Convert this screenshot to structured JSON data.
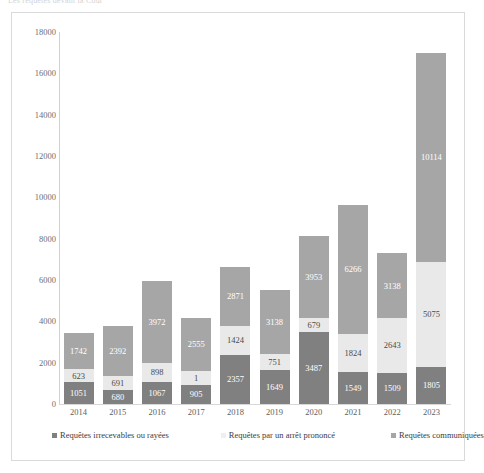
{
  "top_caption": "Les requêtes devant la Cour",
  "chart_data": {
    "type": "bar",
    "subtype": "stacked-vertical",
    "title": "",
    "xlabel": "",
    "ylabel": "",
    "ylim": [
      0,
      18000
    ],
    "ytick_step": 2000,
    "yticks": [
      "0",
      "2000",
      "4000",
      "6000",
      "8000",
      "10000",
      "12000",
      "14000",
      "16000",
      "18000"
    ],
    "grid": false,
    "legend_position": "bottom",
    "categories": [
      "2014",
      "2015",
      "2016",
      "2017",
      "2018",
      "2019",
      "2020",
      "2021",
      "2022",
      "2023"
    ],
    "series": [
      {
        "name": "Requêtes irrecevables ou rayées",
        "color": "#808080",
        "values": [
          1051,
          680,
          1067,
          905,
          2357,
          1649,
          3487,
          1549,
          1509,
          1805
        ],
        "labels": [
          "1051",
          "680",
          "1067",
          "905",
          "2357",
          "1649",
          "3487",
          "1549",
          "1509",
          "1805"
        ]
      },
      {
        "name": "Requêtes par un arrêt prononcé",
        "color": "#e9e9e9",
        "values": [
          623,
          691,
          898,
          700,
          1424,
          751,
          679,
          1824,
          2643,
          5075
        ],
        "labels": [
          "623",
          "691",
          "898",
          "1",
          "1424",
          "751",
          "679",
          "1824",
          "2643",
          "5075"
        ]
      },
      {
        "name": "Requêtes communiquées",
        "color": "#a6a6a6",
        "values": [
          1742,
          2392,
          3972,
          2555,
          2871,
          3138,
          3953,
          6266,
          3138,
          10114
        ],
        "labels": [
          "1742",
          "2392",
          "3972",
          "2555",
          "2871",
          "3138",
          "3953",
          "6266",
          "3138",
          "10114"
        ]
      }
    ],
    "totals": [
      3416,
      3763,
      5937,
      4160,
      6652,
      5538,
      8119,
      9639,
      7290,
      16994
    ]
  }
}
